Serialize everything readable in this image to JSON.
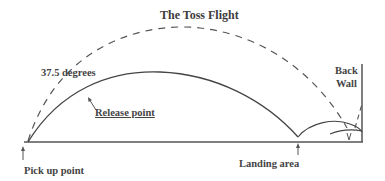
{
  "title": "The Toss Flight",
  "labels": {
    "angle": "37.5 degrees",
    "release_point": "Release point",
    "pick_up_point": "Pick up point",
    "landing_area": "Landing area",
    "back_wall_line1": "Back",
    "back_wall_line2": "Wall"
  },
  "colors": {
    "line": "#444444",
    "text": "#444444",
    "background": "#ffffff"
  }
}
